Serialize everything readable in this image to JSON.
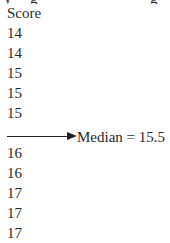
{
  "table": {
    "header": "Score",
    "values_before_median": [
      "14",
      "14",
      "15",
      "15",
      "15"
    ],
    "values_after_median": [
      "16",
      "16",
      "17",
      "17",
      "17"
    ]
  },
  "median_marker": {
    "label": "Median = 15.5",
    "icon": "right-arrow-icon"
  }
}
